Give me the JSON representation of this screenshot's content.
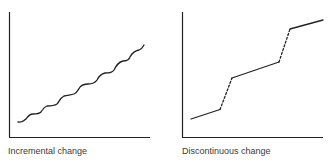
{
  "panels": [
    {
      "id": "incremental",
      "caption": "Incremental change",
      "line_style": "wavy continuous stepped rise",
      "stroke_color": "#222222"
    },
    {
      "id": "discontinuous",
      "caption": "Discontinuous change",
      "line_style": "solid segments joined by dashed jumps",
      "stroke_color": "#222222"
    }
  ],
  "colors": {
    "axis": "#222222",
    "background": "#ffffff",
    "caption_text": "#3a3a3a"
  }
}
